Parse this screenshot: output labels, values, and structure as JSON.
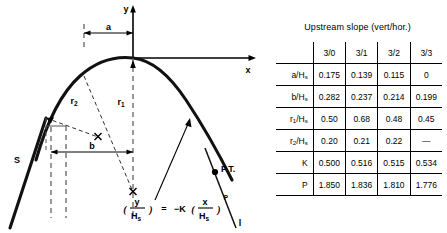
{
  "diagram": {
    "axis_y_label": "y",
    "axis_x_label": "x",
    "dim_a_label": "a",
    "dim_b_label": "b",
    "radius_1_label": "r",
    "radius_1_sub": "1",
    "radius_2_label": "r",
    "radius_2_sub": "2",
    "upstream_face_label": "S",
    "tangent_point_label": "P.T.",
    "downstream_slope_label": "l",
    "equation": {
      "open_paren": "(",
      "numerator": "y",
      "denominator": "H",
      "denominator_sub": "s",
      "close_paren": ")",
      "equals": "=",
      "minus_k": "−K",
      "x_open_paren": "(",
      "x_numerator": "x",
      "x_denominator": "H",
      "x_denominator_sub": "s",
      "x_close_paren": ")",
      "exponent": "P",
      "plain_text": "(y/Hs) = -K(x/Hs)^P"
    }
  },
  "table": {
    "caption": "Upstream slope (vert/hor.)",
    "corner_label": "",
    "columns": [
      "3/0",
      "3/1",
      "3/2",
      "3/3"
    ],
    "rows": [
      {
        "label_main": "a/H",
        "label_sub": "s",
        "values": [
          "0.175",
          "0.139",
          "0.115",
          "0"
        ]
      },
      {
        "label_main": "b/H",
        "label_sub": "s",
        "values": [
          "0.282",
          "0.237",
          "0.214",
          "0.199"
        ]
      },
      {
        "label_main": "r",
        "label_mid_sub": "1",
        "label_tail": "/H",
        "label_sub": "s",
        "values": [
          "0.50",
          "0.68",
          "0.48",
          "0.45"
        ]
      },
      {
        "label_main": "r",
        "label_mid_sub": "2",
        "label_tail": "/H",
        "label_sub": "s",
        "values": [
          "0.20",
          "0.21",
          "0.22",
          "—"
        ]
      },
      {
        "label_main": "K",
        "values": [
          "0.500",
          "0.516",
          "0.515",
          "0.534"
        ]
      },
      {
        "label_main": "P",
        "values": [
          "1.850",
          "1.836",
          "1.810",
          "1.776"
        ]
      }
    ]
  },
  "colors": {
    "ink": "#000000",
    "background": "#ffffff",
    "crest_curve": "#111111",
    "dashed_guide": "#555555"
  }
}
